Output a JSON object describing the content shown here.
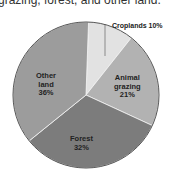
{
  "caption": "grazing, forest, and other land.",
  "chart_data": {
    "type": "pie",
    "title": "",
    "categories": [
      "Croplands",
      "Animal grazing",
      "Forest",
      "Other land"
    ],
    "values": [
      10,
      21,
      32,
      36
    ],
    "labels": [
      "Croplands 10%",
      "Animal grazing 21%",
      "Forest 32%",
      "Other land 36%"
    ],
    "colors": [
      "#e2e2e2",
      "#b2b2b2",
      "#7c7c7c",
      "#9c9c9c"
    ],
    "start_angle": "top, clockwise",
    "legend": "none (direct labels)"
  },
  "labels": {
    "croplands": "Croplands 10%",
    "grazing_1": "Animal",
    "grazing_2": "grazing",
    "grazing_3": "21%",
    "forest_1": "Forest",
    "forest_2": "32%",
    "other_1": "Other",
    "other_2": "land",
    "other_3": "36%"
  }
}
